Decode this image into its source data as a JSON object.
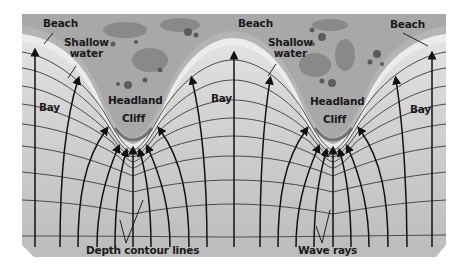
{
  "diagram": {
    "type": "wave refraction at headlands and bays",
    "labels": {
      "beach_left": "Beach",
      "beach_mid": "Beach",
      "beach_right": "Beach",
      "shallow_water_left": [
        "Shallow",
        "water"
      ],
      "shallow_water_right": [
        "Shallow",
        "water"
      ],
      "headland_left": "Headland",
      "headland_right": "Headland",
      "cliff_left": "Cliff",
      "cliff_right": "Cliff",
      "bay_left": "Bay",
      "bay_mid": "Bay",
      "bay_right": "Bay",
      "depth_contours": "Depth contour lines",
      "wave_rays": "Wave rays"
    },
    "colors": {
      "land": "#a9a9a9",
      "land_dark": "#6e6e6e",
      "beach": "#bdbdbd",
      "shallow": "#e6e6e6",
      "sea": "#c4c4c4",
      "ray": "#111111",
      "contour": "#4a4a4a"
    }
  }
}
